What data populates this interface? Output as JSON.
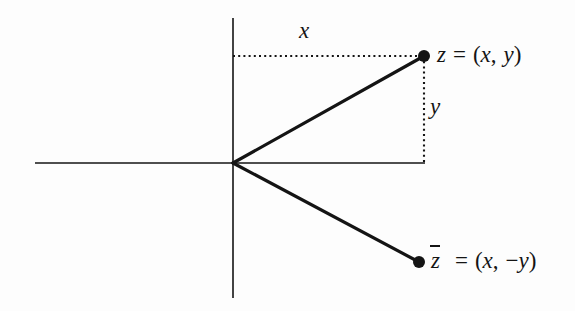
{
  "figure": {
    "type": "complex-plane-conjugate-diagram",
    "background_color": "#fdfdfd",
    "ink_color": "#141414",
    "axes": {
      "vertical": {
        "x": 233,
        "y_top": 18,
        "y_bottom": 298,
        "stroke_width": 1.6
      },
      "horizontal": {
        "y": 163,
        "x_left": 35,
        "x_right": 425,
        "stroke_width": 1.6
      },
      "origin": {
        "x": 233,
        "y": 163
      }
    },
    "points": [
      {
        "name": "z",
        "x": 424,
        "y": 56,
        "radius": 6
      },
      {
        "name": "z-conjugate",
        "x": 419,
        "y": 262,
        "radius": 6
      }
    ],
    "rays": [
      {
        "name": "ray-to-z",
        "x1": 233,
        "y1": 163,
        "x2": 424,
        "y2": 56,
        "stroke_width": 3.2
      },
      {
        "name": "ray-to-z-conjugate",
        "x1": 233,
        "y1": 163,
        "x2": 419,
        "y2": 262,
        "stroke_width": 3.2
      }
    ],
    "dotted_guides": [
      {
        "name": "horizontal-guide-x",
        "x1": 233,
        "y1": 56,
        "x2": 424,
        "y2": 56
      },
      {
        "name": "vertical-guide-y",
        "x1": 424,
        "y1": 56,
        "x2": 424,
        "y2": 163
      }
    ]
  },
  "labels": {
    "x_axis_segment": "x",
    "y_axis_segment": "y",
    "z_variable": "z",
    "z_equals": "=",
    "z_value_open": "(",
    "z_value_real": "x",
    "z_value_comma": ",",
    "z_value_imag": "y",
    "z_value_close": ")",
    "zbar_variable": "z",
    "zbar_equals": "=",
    "zbar_value_open": "(",
    "zbar_value_real": "x",
    "zbar_value_comma": ",",
    "zbar_value_minus": "−",
    "zbar_value_imag": "y",
    "zbar_value_close": ")"
  }
}
